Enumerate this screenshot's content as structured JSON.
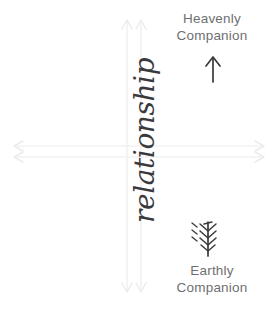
{
  "diagram": {
    "background_color": "#ffffff",
    "axis_color": "#f2f2f3",
    "label_color": "#6f6f72",
    "script_color": "#3a3a3c",
    "labels": {
      "top": {
        "line1": "Heavenly",
        "line2": "Companion"
      },
      "bottom": {
        "line1": "Earthly",
        "line2": "Companion"
      }
    },
    "vertical_arrow": {
      "word": "relationship",
      "head_direction": "up",
      "tail_style": "fletched"
    },
    "axes": [
      {
        "name": "horizontal-axis",
        "orientation": "horizontal",
        "arrowheads": "both"
      },
      {
        "name": "vertical-axis",
        "orientation": "vertical",
        "arrowheads": "both"
      }
    ]
  }
}
